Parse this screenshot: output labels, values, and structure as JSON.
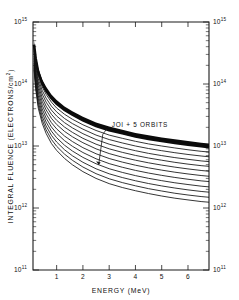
{
  "chart_data": {
    "type": "line",
    "title": "",
    "xlabel": "ENERGY (MeV)",
    "ylabel": "INTEGRAL FLUENCE (ELECTRONS/cm2)",
    "ylabel_display": "INTEGRAL FLUENCE (ELECTRONS/cm",
    "ylabel_sup": "2",
    "ylabel_close": ")",
    "xscale": "linear",
    "yscale": "log",
    "xlim": [
      0.1,
      6.8
    ],
    "ylim": [
      100000000000.0,
      1000000000000000.0
    ],
    "grid": false,
    "legend": "none",
    "xticks": [
      1,
      2,
      3,
      4,
      5,
      6
    ],
    "xticklabels": [
      "1",
      "2",
      "3",
      "4",
      "5",
      "6"
    ],
    "yticks": [
      100000000000.0,
      1000000000000.0,
      10000000000000.0,
      100000000000000.0,
      1000000000000000.0
    ],
    "yticklabels_left": [
      "10",
      "10",
      "10",
      "10",
      "10"
    ],
    "yticklabels_left_exp": [
      "11",
      "12",
      "13",
      "14",
      "15"
    ],
    "yticklabels_right": [
      "10",
      "10",
      "10",
      "10",
      "10"
    ],
    "yticklabels_right_exp": [
      "11",
      "12",
      "13",
      "14",
      "15"
    ],
    "annotations": [
      {
        "text": "JOI + 5 ORBITS",
        "x": 3.1,
        "y": 20000000000000.0,
        "leader_to_x": 2.6,
        "leader_to_y": 5000000000000.0
      }
    ],
    "series": [
      {
        "name": "curve-1",
        "x": [
          0.14,
          0.2,
          0.3,
          0.45,
          0.6,
          0.8,
          1.0,
          1.3,
          1.6,
          2.0,
          2.5,
          3.0,
          3.5,
          4.0,
          4.5,
          5.0,
          5.5,
          6.0,
          6.5,
          6.8
        ],
        "values": [
          430000000000000.0,
          260000000000000.0,
          155000000000000.0,
          102000000000000.0,
          78000000000000.0,
          59000000000000.0,
          48000000000000.0,
          38000000000000.0,
          32000000000000.0,
          26000000000000.0,
          21000000000000.0,
          18000000000000.0,
          16000000000000.0,
          14200000000000.0,
          13000000000000.0,
          12000000000000.0,
          11200000000000.0,
          10500000000000.0,
          9900000000000.0,
          9600000000000.0
        ]
      },
      {
        "name": "curve-2",
        "x": [
          0.14,
          0.2,
          0.3,
          0.45,
          0.6,
          0.8,
          1.0,
          1.3,
          1.6,
          2.0,
          2.5,
          3.0,
          3.5,
          4.0,
          4.5,
          5.0,
          5.5,
          6.0,
          6.5,
          6.8
        ],
        "values": [
          400000000000000.0,
          235000000000000.0,
          138000000000000.0,
          90000000000000.0,
          68000000000000.0,
          51000000000000.0,
          41000000000000.0,
          32500000000000.0,
          27000000000000.0,
          22000000000000.0,
          17800000000000.0,
          15000000000000.0,
          13300000000000.0,
          11900000000000.0,
          10800000000000.0,
          10000000000000.0,
          9300000000000.0,
          8700000000000.0,
          8200000000000.0,
          8000000000000.0
        ]
      },
      {
        "name": "curve-3",
        "x": [
          0.14,
          0.2,
          0.3,
          0.45,
          0.6,
          0.8,
          1.0,
          1.3,
          1.6,
          2.0,
          2.5,
          3.0,
          3.5,
          4.0,
          4.5,
          5.0,
          5.5,
          6.0,
          6.5,
          6.8
        ],
        "values": [
          370000000000000.0,
          210000000000000.0,
          122000000000000.0,
          79000000000000.0,
          59000000000000.0,
          44000000000000.0,
          35500000000000.0,
          27800000000000.0,
          23000000000000.0,
          18700000000000.0,
          15000000000000.0,
          12700000000000.0,
          11200000000000.0,
          10000000000000.0,
          9100000000000.0,
          8400000000000.0,
          7800000000000.0,
          7300000000000.0,
          6900000000000.0,
          6700000000000.0
        ]
      },
      {
        "name": "curve-4",
        "x": [
          0.14,
          0.2,
          0.3,
          0.45,
          0.6,
          0.8,
          1.0,
          1.3,
          1.6,
          2.0,
          2.5,
          3.0,
          3.5,
          4.0,
          4.5,
          5.0,
          5.5,
          6.0,
          6.5,
          6.8
        ],
        "values": [
          340000000000000.0,
          190000000000000.0,
          108000000000000.0,
          69000000000000.0,
          51000000000000.0,
          38000000000000.0,
          30500000000000.0,
          23800000000000.0,
          19600000000000.0,
          15800000000000.0,
          12700000000000.0,
          10700000000000.0,
          9400000000000.0,
          8400000000000.0,
          7600000000000.0,
          7000000000000.0,
          6500000000000.0,
          6100000000000.0,
          5750000000000.0,
          5600000000000.0
        ]
      },
      {
        "name": "curve-5",
        "x": [
          0.14,
          0.2,
          0.3,
          0.45,
          0.6,
          0.8,
          1.0,
          1.3,
          1.6,
          2.0,
          2.5,
          3.0,
          3.5,
          4.0,
          4.5,
          5.0,
          5.5,
          6.0,
          6.5,
          6.8
        ],
        "values": [
          310000000000000.0,
          170000000000000.0,
          95000000000000.0,
          60000000000000.0,
          44000000000000.0,
          32500000000000.0,
          26000000000000.0,
          20200000000000.0,
          16600000000000.0,
          13300000000000.0,
          10700000000000.0,
          9000000000000.0,
          7900000000000.0,
          7050000000000.0,
          6400000000000.0,
          5900000000000.0,
          5450000000000.0,
          5100000000000.0,
          4820000000000.0,
          4700000000000.0
        ]
      },
      {
        "name": "curve-6",
        "x": [
          0.14,
          0.2,
          0.3,
          0.45,
          0.6,
          0.8,
          1.0,
          1.3,
          1.6,
          2.0,
          2.5,
          3.0,
          3.5,
          4.0,
          4.5,
          5.0,
          5.5,
          6.0,
          6.5,
          6.8
        ],
        "values": [
          285000000000000.0,
          154000000000000.0,
          84000000000000.0,
          52500000000000.0,
          38200000000000.0,
          28000000000000.0,
          22300000000000.0,
          17200000000000.0,
          14100000000000.0,
          11300000000000.0,
          9000000000000.0,
          7550000000000.0,
          6600000000000.0,
          5900000000000.0,
          5350000000000.0,
          4920000000000.0,
          4560000000000.0,
          4270000000000.0,
          4030000000000.0,
          3920000000000.0
        ]
      },
      {
        "name": "curve-7",
        "x": [
          0.14,
          0.2,
          0.3,
          0.45,
          0.6,
          0.8,
          1.0,
          1.3,
          1.6,
          2.0,
          2.5,
          3.0,
          3.5,
          4.0,
          4.5,
          5.0,
          5.5,
          6.0,
          6.5,
          6.8
        ],
        "values": [
          260000000000000.0,
          138000000000000.0,
          74000000000000.0,
          45500000000000.0,
          32800000000000.0,
          23800000000000.0,
          18900000000000.0,
          14500000000000.0,
          11800000000000.0,
          9400000000000.0,
          7500000000000.0,
          6280000000000.0,
          5500000000000.0,
          4900000000000.0,
          4440000000000.0,
          4080000000000.0,
          3780000000000.0,
          3540000000000.0,
          3340000000000.0,
          3250000000000.0
        ]
      },
      {
        "name": "curve-8",
        "x": [
          0.14,
          0.2,
          0.3,
          0.45,
          0.6,
          0.8,
          1.0,
          1.3,
          1.6,
          2.0,
          2.5,
          3.0,
          3.5,
          4.0,
          4.5,
          5.0,
          5.5,
          6.0,
          6.5,
          6.8
        ],
        "values": [
          238000000000000.0,
          124000000000000.0,
          65000000000000.0,
          39500000000000.0,
          28200000000000.0,
          20300000000000.0,
          16000000000000.0,
          12200000000000.0,
          9900000000000.0,
          7850000000000.0,
          6220000000000.0,
          5200000000000.0,
          4540000000000.0,
          4040000000000.0,
          3660000000000.0,
          3360000000000.0,
          3110000000000.0,
          2910000000000.0,
          2740000000000.0,
          2670000000000.0
        ]
      },
      {
        "name": "curve-9",
        "x": [
          0.14,
          0.2,
          0.3,
          0.45,
          0.6,
          0.8,
          1.0,
          1.3,
          1.6,
          2.0,
          2.5,
          3.0,
          3.5,
          4.0,
          4.5,
          5.0,
          5.5,
          6.0,
          6.5,
          6.8
        ],
        "values": [
          218000000000000.0,
          112000000000000.0,
          57500000000000.0,
          34400000000000.0,
          24300000000000.0,
          17400000000000.0,
          13600000000000.0,
          10300000000000.0,
          8300000000000.0,
          6550000000000.0,
          5170000000000.0,
          4300000000000.0,
          3750000000000.0,
          3330000000000.0,
          3010000000000.0,
          2760000000000.0,
          2550000000000.0,
          2390000000000.0,
          2250000000000.0,
          2190000000000.0
        ]
      },
      {
        "name": "curve-10",
        "x": [
          0.14,
          0.2,
          0.3,
          0.45,
          0.6,
          0.8,
          1.0,
          1.3,
          1.6,
          2.0,
          2.5,
          3.0,
          3.5,
          4.0,
          4.5,
          5.0,
          5.5,
          6.0,
          6.5,
          6.8
        ],
        "values": [
          200000000000000.0,
          101000000000000.0,
          51000000000000.0,
          30000000000000.0,
          21000000000000.0,
          14900000000000.0,
          11600000000000.0,
          8700000000000.0,
          6960000000000.0,
          5460000000000.0,
          4290000000000.0,
          3560000000000.0,
          3100000000000.0,
          2750000000000.0,
          2480000000000.0,
          2270000000000.0,
          2100000000000.0,
          1960000000000.0,
          1850000000000.0,
          1800000000000.0
        ]
      },
      {
        "name": "curve-11",
        "x": [
          0.14,
          0.2,
          0.3,
          0.45,
          0.6,
          0.8,
          1.0,
          1.3,
          1.6,
          2.0,
          2.5,
          3.0,
          3.5,
          4.0,
          4.5,
          5.0,
          5.5,
          6.0,
          6.5,
          6.8
        ],
        "values": [
          184000000000000.0,
          92000000000000.0,
          45500000000000.0,
          26300000000000.0,
          18200000000000.0,
          12800000000000.0,
          9900000000000.0,
          7400000000000.0,
          5880000000000.0,
          4580000000000.0,
          3580000000000.0,
          2960000000000.0,
          2570000000000.0,
          2280000000000.0,
          2050000000000.0,
          1880000000000.0,
          1730000000000.0,
          1620000000000.0,
          1530000000000.0,
          1490000000000.0
        ]
      },
      {
        "name": "curve-12",
        "x": [
          0.14,
          0.2,
          0.3,
          0.45,
          0.6,
          0.8,
          1.0,
          1.3,
          1.6,
          2.0,
          2.5,
          3.0,
          3.5,
          4.0,
          4.5,
          5.0,
          5.5,
          6.0,
          6.5,
          6.8
        ],
        "values": [
          170000000000000.0,
          84000000000000.0,
          40800000000000.0,
          23200000000000.0,
          15900000000000.0,
          11000000000000.0,
          8500000000000.0,
          6300000000000.0,
          4980000000000.0,
          3860000000000.0,
          3000000000000.0,
          2470000000000.0,
          2140000000000.0,
          1900000000000.0,
          1710000000000.0,
          1560000000000.0,
          1440000000000.0,
          1350000000000.0,
          1270000000000.0,
          1240000000000.0
        ]
      }
    ],
    "band": {
      "name": "dense-upper-envelope",
      "x": [
        0.14,
        0.2,
        0.3,
        0.45,
        0.6,
        0.8,
        1.0,
        1.3,
        1.6,
        2.0,
        2.5,
        3.0,
        3.5,
        4.0,
        4.5,
        5.0,
        5.5,
        6.0,
        6.5,
        6.8
      ],
      "upper": [
        500000000000000.0,
        300000000000000.0,
        180000000000000.0,
        118000000000000.0,
        90000000000000.0,
        68000000000000.0,
        55000000000000.0,
        43500000000000.0,
        36500000000000.0,
        29700000000000.0,
        24000000000000.0,
        20600000000000.0,
        18300000000000.0,
        16200000000000.0,
        14900000000000.0,
        13700000000000.0,
        12800000000000.0,
        12000000000000.0,
        11300000000000.0,
        11000000000000.0
      ],
      "lower": [
        430000000000000.0,
        260000000000000.0,
        155000000000000.0,
        102000000000000.0,
        78000000000000.0,
        59000000000000.0,
        48000000000000.0,
        38000000000000.0,
        32000000000000.0,
        26000000000000.0,
        21000000000000.0,
        18000000000000.0,
        16000000000000.0,
        14200000000000.0,
        13000000000000.0,
        12000000000000.0,
        11200000000000.0,
        10500000000000.0,
        9900000000000.0,
        9600000000000.0
      ]
    }
  }
}
